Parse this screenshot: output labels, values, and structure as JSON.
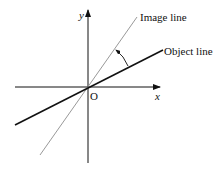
{
  "diagram": {
    "labels": {
      "y_axis": "y",
      "x_axis": "x",
      "origin": "O",
      "image_line": "Image line",
      "object_line": "Object line"
    },
    "colors": {
      "axes": "#111111",
      "object_line": "#111111",
      "image_line": "#999999"
    }
  }
}
